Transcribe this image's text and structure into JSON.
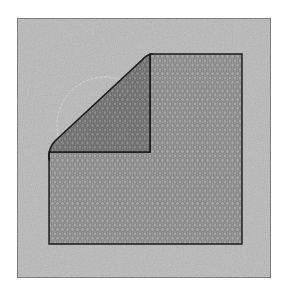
{
  "figure": {
    "title": "Folded mesh sheet on square backing",
    "colors": {
      "page_background": "#ffffff",
      "backing_fill": "#b9b9b9",
      "backing_border": "#3a3a3a",
      "mesh_fill": "#a8a8a8",
      "mesh_cell_stroke": "#7a7a7a",
      "flap_fill": "#8e8e8e",
      "flap_cell_stroke": "#5e5e5e",
      "outline": "#1a1a1a",
      "circle_outline": "#d4d4d4"
    },
    "backing": {
      "x": 17,
      "y": 18,
      "width": 254,
      "height": 260
    },
    "sheet": {
      "left": 49,
      "top": 54,
      "right": 242,
      "bottom": 244
    },
    "fold": {
      "crease_x": 150,
      "crease_y": 152
    },
    "hidden_circle": {
      "cx": 105,
      "cy": 125,
      "r": 48
    }
  }
}
